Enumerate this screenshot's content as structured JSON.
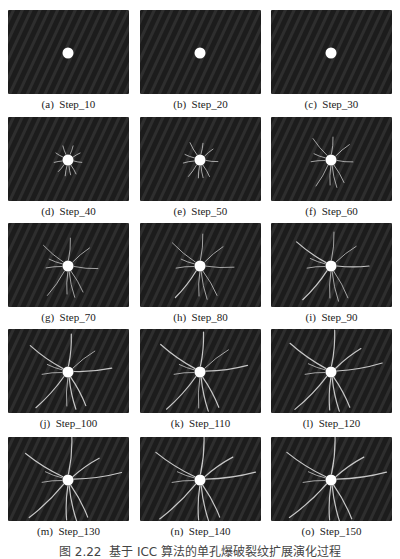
{
  "figure": {
    "caption": "图 2.22  基于 ICC 算法的单孔爆破裂纹扩展演化过程",
    "colors": {
      "background": "#232323",
      "stripe_dark": "#1c1c1c",
      "stripe_light": "#2e2e2e",
      "hole": "#ffffff",
      "crack": "#d8d8d8"
    },
    "panels": [
      {
        "label": "(a)  Step_10",
        "letter": "a",
        "step": 10,
        "cracks": []
      },
      {
        "label": "(b)  Step_20",
        "letter": "b",
        "step": 20,
        "cracks": []
      },
      {
        "label": "(c)  Step_30",
        "letter": "c",
        "step": 30,
        "cracks": []
      },
      {
        "label": "(d)  Step_40",
        "letter": "d",
        "step": 40,
        "cracks": [
          [
            -110,
            9
          ],
          [
            -70,
            9
          ],
          [
            -30,
            8
          ],
          [
            10,
            8
          ],
          [
            60,
            10
          ],
          [
            100,
            10
          ],
          [
            130,
            9
          ],
          [
            170,
            8
          ],
          [
            -150,
            8
          ],
          [
            80,
            9
          ]
        ]
      },
      {
        "label": "(e)  Step_50",
        "letter": "e",
        "step": 50,
        "cracks": [
          [
            -120,
            14
          ],
          [
            -80,
            11
          ],
          [
            -40,
            11
          ],
          [
            5,
            12
          ],
          [
            60,
            13
          ],
          [
            95,
            12
          ],
          [
            125,
            14
          ],
          [
            170,
            11
          ],
          [
            -160,
            10
          ],
          [
            80,
            12
          ]
        ]
      },
      {
        "label": "(f)  Step_60",
        "letter": "f",
        "step": 60,
        "cracks": [
          [
            -130,
            22
          ],
          [
            -85,
            17
          ],
          [
            -40,
            18
          ],
          [
            5,
            16
          ],
          [
            60,
            20
          ],
          [
            92,
            19
          ],
          [
            120,
            24
          ],
          [
            175,
            14
          ],
          [
            -160,
            12
          ],
          [
            78,
            22
          ]
        ]
      },
      {
        "label": "(g)  Step_70",
        "letter": "g",
        "step": 70,
        "cracks": [
          [
            -140,
            26
          ],
          [
            -85,
            22
          ],
          [
            -40,
            22
          ],
          [
            5,
            24
          ],
          [
            60,
            24
          ],
          [
            92,
            22
          ],
          [
            125,
            30
          ],
          [
            175,
            16
          ],
          [
            -160,
            14
          ],
          [
            78,
            26
          ]
        ]
      },
      {
        "label": "(h)  Step_80",
        "letter": "h",
        "step": 80,
        "cracks": [
          [
            -140,
            30
          ],
          [
            -85,
            26
          ],
          [
            -40,
            24
          ],
          [
            2,
            28
          ],
          [
            60,
            28
          ],
          [
            92,
            24
          ],
          [
            128,
            34
          ],
          [
            175,
            18
          ],
          [
            -160,
            14
          ],
          [
            78,
            28
          ]
        ]
      },
      {
        "label": "(i)  Step_90",
        "letter": "i",
        "step": 90,
        "cracks": [
          [
            -145,
            36
          ],
          [
            -85,
            28
          ],
          [
            -38,
            26
          ],
          [
            0,
            32
          ],
          [
            62,
            30
          ],
          [
            92,
            26
          ],
          [
            130,
            38
          ],
          [
            175,
            18
          ],
          [
            -160,
            16
          ],
          [
            78,
            30
          ]
        ]
      },
      {
        "label": "(j)  Step_100",
        "letter": "j",
        "step": 100,
        "cracks": [
          [
            -145,
            40
          ],
          [
            -85,
            32
          ],
          [
            -38,
            28
          ],
          [
            -5,
            38
          ],
          [
            62,
            32
          ],
          [
            92,
            28
          ],
          [
            132,
            42
          ],
          [
            175,
            20
          ],
          [
            -160,
            16
          ],
          [
            78,
            32
          ]
        ]
      },
      {
        "label": "(k)  Step_110",
        "letter": "k",
        "step": 110,
        "cracks": [
          [
            -145,
            42
          ],
          [
            -85,
            34
          ],
          [
            -38,
            30
          ],
          [
            -8,
            42
          ],
          [
            62,
            34
          ],
          [
            92,
            30
          ],
          [
            132,
            44
          ],
          [
            175,
            20
          ],
          [
            -160,
            16
          ],
          [
            78,
            34
          ]
        ]
      },
      {
        "label": "(l)  Step_120",
        "letter": "l",
        "step": 120,
        "cracks": [
          [
            -145,
            44
          ],
          [
            -85,
            36
          ],
          [
            -38,
            32
          ],
          [
            -10,
            46
          ],
          [
            62,
            34
          ],
          [
            92,
            32
          ],
          [
            134,
            46
          ],
          [
            175,
            20
          ],
          [
            -160,
            18
          ],
          [
            78,
            34
          ]
        ]
      },
      {
        "label": "(m)  Step_130",
        "letter": "m",
        "step": 130,
        "cracks": [
          [
            -148,
            44
          ],
          [
            -85,
            38
          ],
          [
            -35,
            32
          ],
          [
            -8,
            48
          ],
          [
            62,
            36
          ],
          [
            92,
            34
          ],
          [
            136,
            48
          ],
          [
            175,
            20
          ],
          [
            -160,
            18
          ],
          [
            78,
            36
          ]
        ]
      },
      {
        "label": "(n)  Step_140",
        "letter": "n",
        "step": 140,
        "cracks": [
          [
            -148,
            46
          ],
          [
            -85,
            40
          ],
          [
            -35,
            34
          ],
          [
            -8,
            50
          ],
          [
            62,
            36
          ],
          [
            92,
            34
          ],
          [
            136,
            50
          ],
          [
            175,
            22
          ],
          [
            -160,
            18
          ],
          [
            78,
            36
          ]
        ]
      },
      {
        "label": "(o)  Step_150",
        "letter": "o",
        "step": 150,
        "cracks": [
          [
            -148,
            46
          ],
          [
            -85,
            40
          ],
          [
            -35,
            34
          ],
          [
            -8,
            50
          ],
          [
            62,
            38
          ],
          [
            92,
            34
          ],
          [
            138,
            50
          ],
          [
            175,
            22
          ],
          [
            -160,
            18
          ],
          [
            78,
            38
          ]
        ]
      }
    ]
  }
}
